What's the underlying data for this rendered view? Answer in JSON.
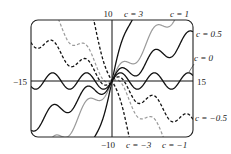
{
  "chart_data": {
    "type": "line",
    "title": "",
    "function": "y = c*x + sin(x)",
    "xlabel": "",
    "ylabel": "",
    "xlim": [
      -15,
      15
    ],
    "ylim": [
      -10,
      10
    ],
    "grid": false,
    "axis_labels": {
      "x_left": "-15",
      "x_right": "15",
      "y_top": "10",
      "y_bottom": "-10"
    },
    "series": [
      {
        "name": "c = 3",
        "c": 3,
        "color": "#111111",
        "dash": "solid",
        "label": "c = 3"
      },
      {
        "name": "c = 1",
        "c": 1,
        "color": "#9a9a9a",
        "dash": "solid",
        "label": "c = 1"
      },
      {
        "name": "c = 0.5",
        "c": 0.5,
        "color": "#111111",
        "dash": "solid",
        "label": "c = 0.5"
      },
      {
        "name": "c = 0",
        "c": 0,
        "color": "#111111",
        "dash": "solid",
        "label": "c = 0"
      },
      {
        "name": "c = -0.5",
        "c": -0.5,
        "color": "#111111",
        "dash": "dashed",
        "label": "c = −0.5"
      },
      {
        "name": "c = -1",
        "c": -1,
        "color": "#9a9a9a",
        "dash": "dashed",
        "label": "c = −1"
      },
      {
        "name": "c = -3",
        "c": -3,
        "color": "#111111",
        "dash": "dashed",
        "label": "c = −3"
      }
    ]
  },
  "labels": {
    "y_top": "10",
    "y_bottom": "−10",
    "x_left": "−15",
    "x_right": "15",
    "c3": "c = 3",
    "c1": "c = 1",
    "c05": "c = 0.5",
    "c0": "c = 0",
    "cm05": "c = −0.5",
    "cm3": "c = −3",
    "cm1": "c = −1"
  }
}
